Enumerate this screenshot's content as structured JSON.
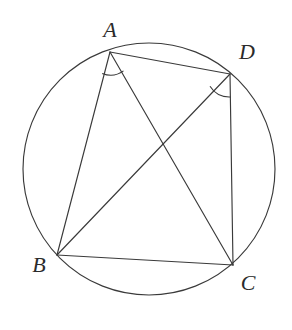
{
  "figure": {
    "background_color": "#ffffff",
    "stroke_color": "#3a3a3a",
    "label_color": "#2b2b2b",
    "stroke_width": 1.15,
    "width": 292,
    "height": 330
  },
  "circle": {
    "name": "circumscribed-circle",
    "cx": 149,
    "cy": 169,
    "r": 126
  },
  "points": [
    {
      "id": "A",
      "label": "A",
      "x": 110,
      "y": 52,
      "label_x": 110,
      "label_y": 30
    },
    {
      "id": "D",
      "label": "D",
      "x": 230,
      "y": 74,
      "label_x": 247,
      "label_y": 52
    },
    {
      "id": "B",
      "label": "B",
      "x": 57,
      "y": 255,
      "label_x": 39,
      "label_y": 265
    },
    {
      "id": "C",
      "label": "C",
      "x": 233,
      "y": 265,
      "label_x": 248,
      "label_y": 283
    }
  ],
  "segments": [
    {
      "name": "segment-AB",
      "from": "A",
      "to": "B",
      "x1": 110,
      "y1": 52,
      "x2": 57,
      "y2": 255
    },
    {
      "name": "segment-AD",
      "from": "A",
      "to": "D",
      "x1": 110,
      "y1": 52,
      "x2": 230,
      "y2": 74
    },
    {
      "name": "segment-AC",
      "from": "A",
      "to": "C",
      "x1": 110,
      "y1": 52,
      "x2": 233,
      "y2": 265
    },
    {
      "name": "segment-BD",
      "from": "B",
      "to": "D",
      "x1": 57,
      "y1": 255,
      "x2": 230,
      "y2": 74
    },
    {
      "name": "segment-BC",
      "from": "B",
      "to": "C",
      "x1": 57,
      "y1": 255,
      "x2": 233,
      "y2": 265
    },
    {
      "name": "segment-DC",
      "from": "D",
      "to": "C",
      "x1": 230,
      "y1": 74,
      "x2": 233,
      "y2": 265
    }
  ],
  "angle_arcs": [
    {
      "name": "angle-arc-BAC",
      "vertex": "A",
      "path": "M 102.2 73.4 A 22 22 0 0 0 123.5 70.9"
    },
    {
      "name": "angle-arc-BDC",
      "vertex": "D",
      "path": "M 210.0 86.3 A 23 23 0 0 0 230.4 97.0"
    }
  ],
  "intersection": {
    "name": "diagonal-intersection",
    "x": 155,
    "y": 148
  }
}
